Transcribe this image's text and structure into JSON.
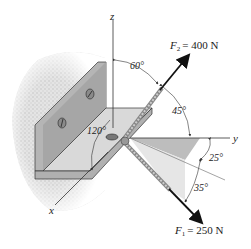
{
  "figure": {
    "type": "statics-force-diagram",
    "axes": {
      "x": "x",
      "y": "y",
      "z": "z"
    },
    "forces": [
      {
        "name": "F",
        "sub": "2",
        "value": "= 400 N"
      },
      {
        "name": "F",
        "sub": "1",
        "value": "= 250 N"
      }
    ],
    "angles": {
      "a60": "60°",
      "a45": "45°",
      "a120": "120°",
      "a25": "25°",
      "a35": "35°"
    },
    "colors": {
      "bracket_face": "#b9b9b9",
      "bracket_dark": "#9a9a9a",
      "bracket_light": "#d6d6d6",
      "wall": "#d8d8d8",
      "shade": "#c8c8c8",
      "line": "#222222"
    }
  }
}
